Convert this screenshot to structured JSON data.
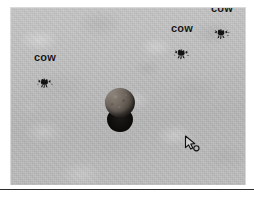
{
  "scene": {
    "name": "3d-game-viewport",
    "ground_color": "#b6b6b6",
    "viewport": {
      "x": 11,
      "y": 8,
      "width": 234,
      "height": 177
    }
  },
  "entities": [
    {
      "label": "cow",
      "sprite": "cow-sprite",
      "color": "#141414",
      "x": 45,
      "y": 76
    },
    {
      "label": "cow",
      "sprite": "cow-sprite",
      "color": "#141414",
      "x": 182,
      "y": 47
    },
    {
      "label": "cow",
      "sprite": "cow-sprite",
      "color": "#141414",
      "x": 222,
      "y": 27
    }
  ],
  "objects": [
    {
      "name": "boulder",
      "type": "rock-sphere",
      "color": "#6d645c",
      "shadow_color": "#0d0c0b",
      "x": 105,
      "y": 88
    }
  ],
  "cursor": {
    "name": "mouse-pointer",
    "glyph": "arrow-cursor-icon",
    "x": 183,
    "y": 134
  },
  "chrome": {
    "rule_color": "#2e2e2e",
    "background": "#ffffff"
  }
}
